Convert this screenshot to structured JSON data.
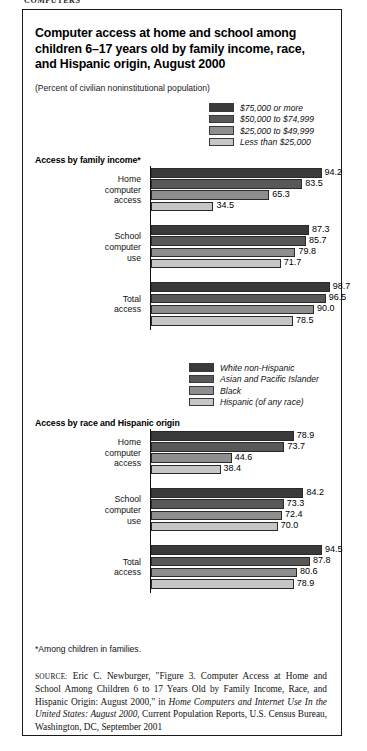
{
  "breadcrumb": "COMPUTERS",
  "figure": {
    "title": "Computer access at home and school among children 6–17 years old by family income, race, and Hispanic origin, August 2000",
    "subtitle": "(Percent of civilian noninstitutional population)",
    "footnote": "*Among children in families.",
    "source_label": "SOURCE:",
    "source_text_1": " Eric C. Newburger, \"Figure 3. Computer Access at Home and School Among Children 6 to 17 Years Old by Family Income, Race, and Hispanic Origin: August 2000,\" in ",
    "source_italic": "Home Computers and Internet Use In the United States: August 2000",
    "source_text_2": ", Current Population Reports, U.S. Census Bureau, Washington, DC, September 2001"
  },
  "colors": {
    "series1": "#3a3a3a",
    "series2": "#585858",
    "series3": "#8e8e8e",
    "series4": "#c6c6c6",
    "axis": "#111111",
    "border": "#1a1a1a"
  },
  "legend_income": {
    "items": [
      {
        "label": "$75,000 or more",
        "color": "#3a3a3a"
      },
      {
        "label": "$50,000 to $74,999",
        "color": "#585858"
      },
      {
        "label": "$25,000 to $49,999",
        "color": "#8e8e8e"
      },
      {
        "label": "Less than $25,000",
        "color": "#c6c6c6"
      }
    ]
  },
  "legend_race": {
    "items": [
      {
        "label": "White non-Hispanic",
        "color": "#3a3a3a"
      },
      {
        "label": "Asian and Pacific Islander",
        "color": "#585858"
      },
      {
        "label": "Black",
        "color": "#8e8e8e"
      },
      {
        "label": "Hispanic (of any race)",
        "color": "#c6c6c6"
      }
    ]
  },
  "section_income": {
    "heading": "Access by family income*",
    "groups": [
      {
        "label_lines": [
          "Home",
          "computer",
          "access"
        ],
        "values": [
          94.2,
          83.5,
          65.3,
          34.5
        ]
      },
      {
        "label_lines": [
          "School",
          "computer",
          "use"
        ],
        "values": [
          87.3,
          85.7,
          79.8,
          71.7
        ]
      },
      {
        "label_lines": [
          "Total",
          "access"
        ],
        "values": [
          98.7,
          96.5,
          90.0,
          78.5
        ]
      }
    ]
  },
  "section_race": {
    "heading": "Access by race and Hispanic origin",
    "groups": [
      {
        "label_lines": [
          "Home",
          "computer",
          "access"
        ],
        "values": [
          78.9,
          73.7,
          44.6,
          38.4
        ]
      },
      {
        "label_lines": [
          "School",
          "computer",
          "use"
        ],
        "values": [
          84.2,
          73.3,
          72.4,
          70.0
        ]
      },
      {
        "label_lines": [
          "Total",
          "access"
        ],
        "values": [
          94.5,
          87.8,
          80.6,
          78.9
        ]
      }
    ]
  },
  "chart_data": [
    {
      "type": "bar",
      "orientation": "horizontal",
      "title": "Access by family income*",
      "subtitle": "(Percent of civilian noninstitutional population)",
      "categories": [
        "Home computer access",
        "School computer use",
        "Total access"
      ],
      "series": [
        {
          "name": "$75,000 or more",
          "values": [
            94.2,
            87.3,
            98.7
          ],
          "color": "#3a3a3a"
        },
        {
          "name": "$50,000 to $74,999",
          "values": [
            83.5,
            85.7,
            96.5
          ],
          "color": "#585858"
        },
        {
          "name": "$25,000 to $49,999",
          "values": [
            65.3,
            79.8,
            90.0
          ],
          "color": "#8e8e8e"
        },
        {
          "name": "Less than $25,000",
          "values": [
            34.5,
            71.7,
            78.5
          ],
          "color": "#c6c6c6"
        }
      ],
      "xlabel": "Percent",
      "ylabel": "",
      "xlim": [
        0,
        100
      ],
      "grid": false,
      "legend_position": "top-right",
      "data_labels": true
    },
    {
      "type": "bar",
      "orientation": "horizontal",
      "title": "Access by race and Hispanic origin",
      "categories": [
        "Home computer access",
        "School computer use",
        "Total access"
      ],
      "series": [
        {
          "name": "White non-Hispanic",
          "values": [
            78.9,
            84.2,
            94.5
          ],
          "color": "#3a3a3a"
        },
        {
          "name": "Asian and Pacific Islander",
          "values": [
            73.7,
            73.3,
            87.8
          ],
          "color": "#585858"
        },
        {
          "name": "Black",
          "values": [
            44.6,
            72.4,
            80.6
          ],
          "color": "#8e8e8e"
        },
        {
          "name": "Hispanic (of any race)",
          "values": [
            38.4,
            70.0,
            78.9
          ],
          "color": "#c6c6c6"
        }
      ],
      "xlabel": "Percent",
      "ylabel": "",
      "xlim": [
        0,
        100
      ],
      "grid": false,
      "legend_position": "top-right",
      "data_labels": true
    }
  ]
}
